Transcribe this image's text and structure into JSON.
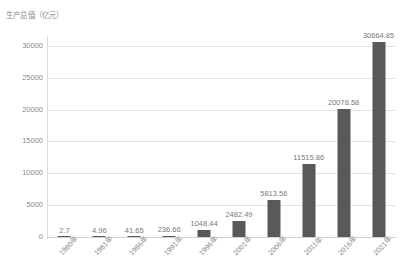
{
  "chart_data": {
    "type": "bar",
    "title": "生产总值（亿元）",
    "xlabel": "",
    "ylabel": "生产总值（亿元）",
    "categories": [
      "1980年",
      "1981年",
      "1986年",
      "1991年",
      "1996年",
      "2001年",
      "2006年",
      "2011年",
      "2016年",
      "2021年"
    ],
    "values": [
      2.7,
      4.96,
      41.65,
      236.66,
      1048.44,
      2482.49,
      5813.56,
      11515.86,
      20078.58,
      30664.85
    ],
    "value_labels": [
      "2.7",
      "4.96",
      "41.65",
      "236.66",
      "1048.44",
      "2482.49",
      "5813.56",
      "11515.86",
      "20078.58",
      "30664.85"
    ],
    "ylim": [
      0,
      31250
    ],
    "yticks": [
      0,
      5000,
      10000,
      15000,
      20000,
      25000,
      30000
    ],
    "ytick_labels": [
      "0",
      "5000",
      "10000",
      "15000",
      "20000",
      "25000",
      "30000"
    ],
    "grid": true,
    "legend": false,
    "series_color": "#595959",
    "grid_color": "#e2e2e2",
    "text_color": "#8c8c8c"
  }
}
